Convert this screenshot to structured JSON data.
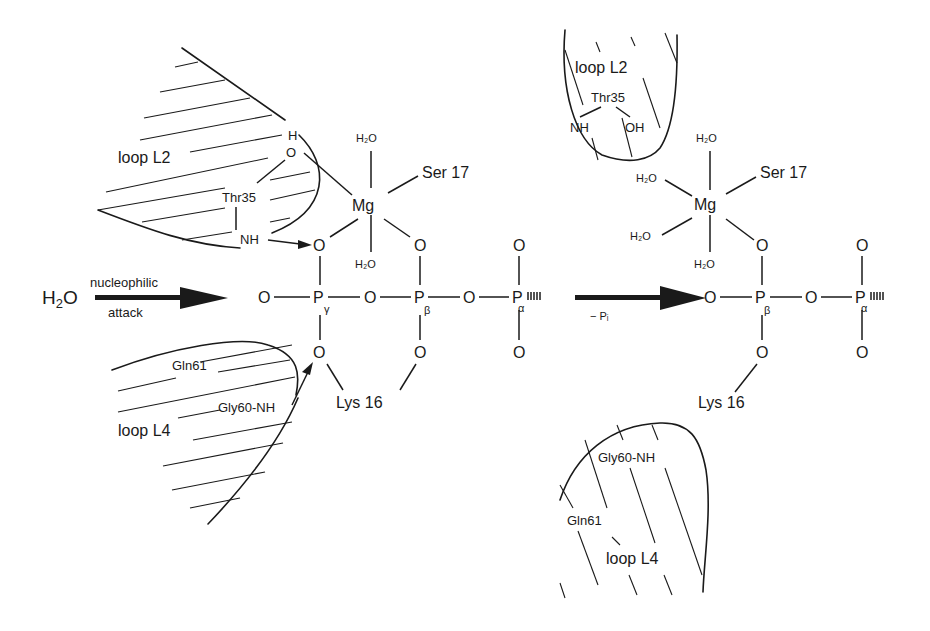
{
  "figure": {
    "left_state": {
      "loop_L2": {
        "label": "loop L2",
        "residue": "Thr35",
        "atoms": [
          "H",
          "O",
          "NH"
        ]
      },
      "loop_L4": {
        "label": "loop L4",
        "residues": [
          "Gln61",
          "Gly60-NH"
        ]
      },
      "mg_complex": {
        "metal": "Mg",
        "ligands": [
          "H2O",
          "H2O",
          "Ser 17"
        ]
      },
      "phosphates": {
        "gamma": {
          "atom": "P",
          "label": "γ"
        },
        "beta": {
          "atom": "P",
          "label": "β"
        },
        "alpha": {
          "atom": "P",
          "label": "α"
        },
        "oxygen": "O"
      },
      "lysine": "Lys 16"
    },
    "nucleophile": {
      "molecule": "H2O",
      "arrow_top": "nucleophilic",
      "arrow_bottom": "attack"
    },
    "reaction_arrow": {
      "label": "− Pi"
    },
    "right_state": {
      "loop_L2": {
        "label": "loop L2",
        "residue": "Thr35",
        "atoms": [
          "NH",
          "OH"
        ]
      },
      "loop_L4": {
        "label": "loop L4",
        "residues": [
          "Gly60-NH",
          "Gln61"
        ]
      },
      "mg_complex": {
        "metal": "Mg",
        "ligands": [
          "H2O",
          "H2O",
          "H2O",
          "H2O",
          "Ser 17"
        ]
      },
      "phosphates": {
        "beta": {
          "atom": "P",
          "label": "β"
        },
        "alpha": {
          "atom": "P",
          "label": "α"
        },
        "oxygen": "O"
      },
      "lysine": "Lys 16"
    }
  }
}
